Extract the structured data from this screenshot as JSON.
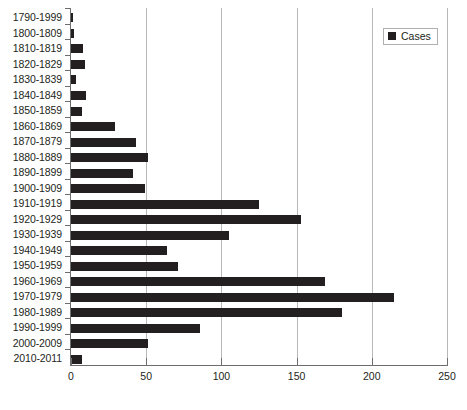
{
  "chart_data": {
    "type": "bar",
    "orientation": "horizontal",
    "title": "",
    "xlabel": "",
    "ylabel": "",
    "xlim": [
      0,
      250
    ],
    "xticks": [
      0,
      50,
      100,
      150,
      200,
      250
    ],
    "grid": true,
    "legend": {
      "position": "top-right",
      "entries": [
        {
          "label": "Cases",
          "color": "#231f20",
          "marker": "filled-square"
        }
      ]
    },
    "series_name": "Cases",
    "bar_color": "#231f20",
    "categories": [
      "1790-1999",
      "1800-1809",
      "1810-1819",
      "1820-1829",
      "1830-1839",
      "1840-1849",
      "1850-1859",
      "1860-1869",
      "1870-1879",
      "1880-1889",
      "1890-1899",
      "1900-1909",
      "1910-1919",
      "1920-1929",
      "1930-1939",
      "1940-1949",
      "1950-1959",
      "1960-1969",
      "1970-1979",
      "1980-1989",
      "1990-1999",
      "2000-2009",
      "2010-2011"
    ],
    "values": [
      1,
      2,
      8,
      9,
      3,
      10,
      7,
      29,
      43,
      51,
      41,
      49,
      125,
      153,
      105,
      64,
      71,
      169,
      215,
      180,
      86,
      51,
      7
    ]
  },
  "legend": {
    "cases_label": "Cases"
  },
  "axis": {
    "x_tick_labels": [
      "0",
      "50",
      "100",
      "150",
      "200",
      "250"
    ]
  }
}
